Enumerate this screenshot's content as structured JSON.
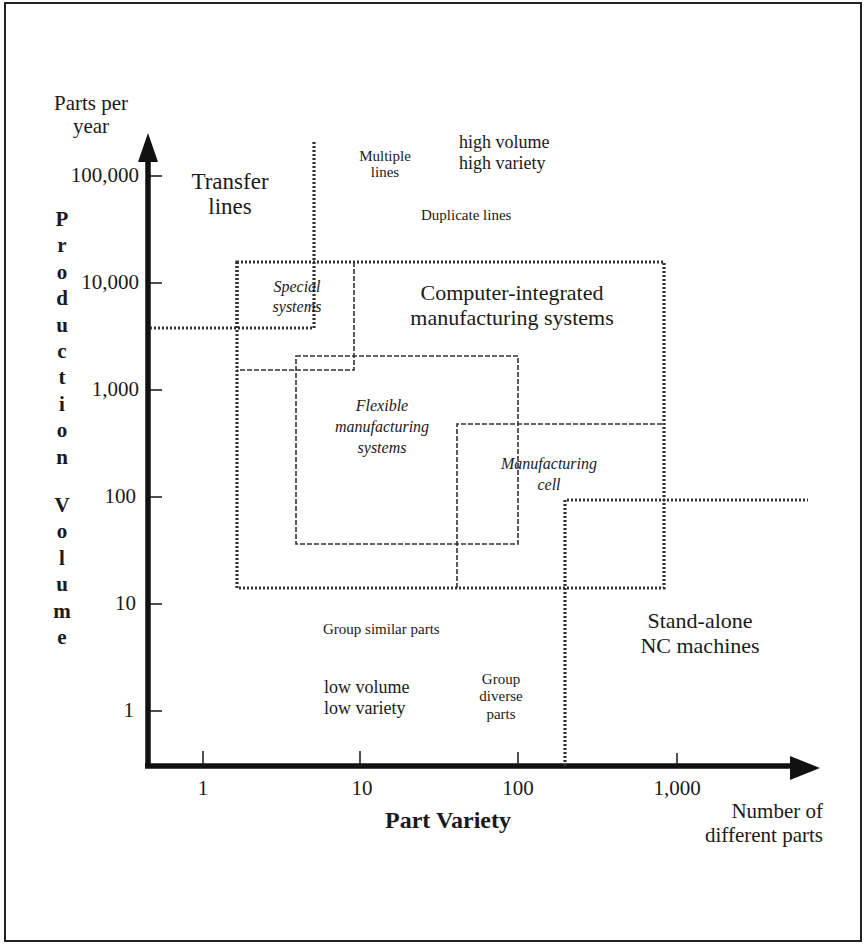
{
  "y_axis": {
    "unit_label_line1": "Parts per",
    "unit_label_line2": "year",
    "title_letters": [
      "P",
      "r",
      "o",
      "d",
      "u",
      "c",
      "t",
      "i",
      "o",
      "n",
      "",
      "V",
      "o",
      "l",
      "u",
      "m",
      "e"
    ],
    "ticks": [
      {
        "label": "100,000",
        "y": 176
      },
      {
        "label": "10,000",
        "y": 283
      },
      {
        "label": "1,000",
        "y": 390
      },
      {
        "label": "100",
        "y": 497
      },
      {
        "label": "10",
        "y": 604
      },
      {
        "label": "1",
        "y": 711
      }
    ]
  },
  "x_axis": {
    "title": "Part Variety",
    "unit_label_line1": "Number of",
    "unit_label_line2": "different parts",
    "ticks": [
      {
        "label": "1",
        "x": 203
      },
      {
        "label": "10",
        "x": 360
      },
      {
        "label": "100",
        "x": 518
      },
      {
        "label": "1,000",
        "x": 677
      }
    ]
  },
  "regions": {
    "transfer_lines": {
      "line1": "Transfer",
      "line2": "lines"
    },
    "multiple_lines": {
      "line1": "Multiple",
      "line2": "lines"
    },
    "high_corner": {
      "line1": "high volume",
      "line2": "high variety"
    },
    "duplicate_lines": "Duplicate lines",
    "special_systems": {
      "line1": "Special",
      "line2": "systems"
    },
    "cim": {
      "line1": "Computer-integrated",
      "line2": "manufacturing systems"
    },
    "fms": {
      "line1": "Flexible",
      "line2": "manufacturing",
      "line3": "systems"
    },
    "mfg_cell": {
      "line1": "Manufacturing",
      "line2": "cell"
    },
    "stand_alone": {
      "line1": "Stand-alone",
      "line2": "NC machines"
    },
    "group_similar": "Group similar parts",
    "low_corner": {
      "line1": "low volume",
      "line2": "low variety"
    },
    "group_diverse": {
      "line1": "Group",
      "line2": "diverse",
      "line3": "parts"
    }
  },
  "colors": {
    "ink": "#1a1a1a",
    "paper": "#ffffff"
  }
}
